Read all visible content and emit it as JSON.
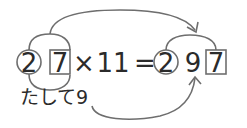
{
  "equation": {
    "left_tens": "2",
    "left_ones": "7",
    "operator_times": "×",
    "multiplier": "11",
    "equals": "=",
    "result_hundreds": "2",
    "result_tens": "9",
    "result_ones": "7"
  },
  "caption": "たして9",
  "colors": {
    "stroke": "#6e6e6e",
    "text": "#2b2b2b",
    "background": "#ffffff"
  }
}
